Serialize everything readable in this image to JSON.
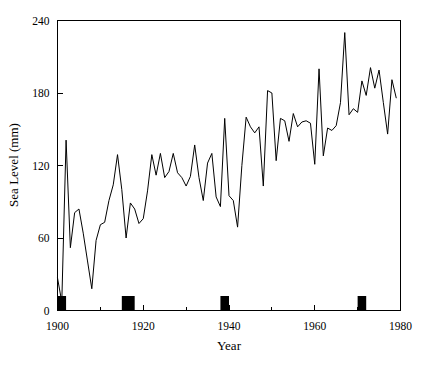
{
  "chart_data": {
    "type": "line",
    "title": "",
    "xlabel": "Year",
    "ylabel": "Sea Level  (mm)",
    "xlim": [
      1900,
      1980
    ],
    "ylim": [
      0,
      240
    ],
    "xticks": [
      1900,
      1920,
      1940,
      1960,
      1980
    ],
    "xtick_labels": [
      "1900",
      "1920",
      "1940",
      "1960",
      "1980"
    ],
    "xminor_ticks": [
      1910,
      1930,
      1950,
      1970
    ],
    "yticks": [
      0,
      60,
      120,
      180,
      240
    ],
    "ytick_labels": [
      "0",
      "60",
      "120",
      "180",
      "240"
    ],
    "grid": false,
    "legend": null,
    "line_color": "#000000",
    "marker_color": "#000000",
    "series": [
      {
        "name": "Sea Level",
        "x": [
          1900,
          1901,
          1902,
          1903,
          1904,
          1905,
          1906,
          1907,
          1908,
          1909,
          1910,
          1911,
          1912,
          1913,
          1914,
          1915,
          1916,
          1917,
          1918,
          1919,
          1920,
          1921,
          1922,
          1923,
          1924,
          1925,
          1926,
          1927,
          1928,
          1929,
          1930,
          1931,
          1932,
          1933,
          1934,
          1935,
          1936,
          1937,
          1938,
          1939,
          1940,
          1941,
          1942,
          1943,
          1944,
          1945,
          1946,
          1947,
          1948,
          1949,
          1950,
          1951,
          1952,
          1953,
          1954,
          1955,
          1956,
          1957,
          1958,
          1959,
          1960,
          1961,
          1962,
          1963,
          1964,
          1965,
          1966,
          1967,
          1968,
          1969,
          1970,
          1971,
          1972,
          1973,
          1974,
          1975,
          1976,
          1977,
          1978,
          1979
        ],
        "values": [
          27,
          7,
          141,
          52,
          81,
          84,
          64,
          41,
          18,
          58,
          71,
          73,
          91,
          104,
          129,
          100,
          60,
          89,
          84,
          72,
          76,
          99,
          129,
          112,
          130,
          110,
          115,
          130,
          114,
          110,
          103,
          111,
          137,
          110,
          91,
          122,
          130,
          94,
          86,
          159,
          95,
          91,
          69,
          120,
          160,
          152,
          147,
          152,
          103,
          182,
          180,
          124,
          159,
          157,
          140,
          163,
          152,
          156,
          157,
          155,
          121,
          200,
          128,
          151,
          149,
          153,
          172,
          230,
          162,
          167,
          164,
          190,
          178,
          201,
          184,
          199,
          172,
          146,
          191,
          176
        ]
      }
    ],
    "event_bars": {
      "description": "black event markers on baseline",
      "value_height": 12,
      "items": [
        {
          "start": 1900,
          "end": 1902
        },
        {
          "start": 1915,
          "end": 1918
        },
        {
          "start": 1938,
          "end": 1940
        },
        {
          "start": 1970,
          "end": 1972
        }
      ]
    }
  },
  "figure": {
    "background_color": "#ffffff",
    "foreground_color": "#000000"
  }
}
